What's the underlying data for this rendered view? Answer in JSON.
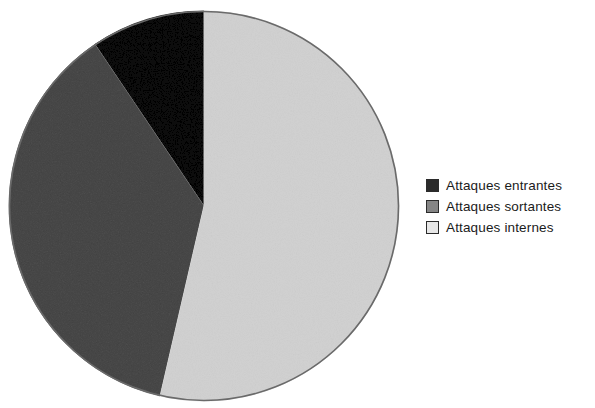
{
  "figure": {
    "background_color": "#ffffff",
    "type": "pie-chart-figure"
  },
  "legend": {
    "position": "right",
    "items": [
      {
        "label": "Attaques entrantes",
        "color": "#2b2b2b",
        "swatch_name": "legend-swatch-attaques-entrantes"
      },
      {
        "label": "Attaques sortantes",
        "color": "#858585",
        "swatch_name": "legend-swatch-attaques-sortantes"
      },
      {
        "label": "Attaques internes",
        "color": "#e7e7e7",
        "swatch_name": "legend-swatch-attaques-internes"
      }
    ]
  },
  "chart_data": {
    "type": "pie",
    "title": "",
    "subtitle": "",
    "xlabel": "",
    "ylabel": "",
    "categories": [
      "Attaques entrantes",
      "Attaques sortantes",
      "Attaques internes"
    ],
    "values": [
      9.5,
      37.0,
      53.5
    ],
    "unit": "%",
    "start_angle_deg": 0,
    "direction": "clockwise",
    "slices": [
      {
        "label": "Attaques entrantes",
        "value": 9.5,
        "color": "#2b2b2b",
        "start_angle_deg": 326,
        "end_angle_deg": 360
      },
      {
        "label": "Attaques sortantes",
        "value": 37.0,
        "color": "#858585",
        "start_angle_deg": 193,
        "end_angle_deg": 326
      },
      {
        "label": "Attaques internes",
        "value": 53.5,
        "color": "#e7e7e7",
        "start_angle_deg": 0,
        "end_angle_deg": 193
      }
    ],
    "legend_position": "right",
    "grid": false,
    "data_labels_shown": false,
    "outline_color": "#555555",
    "center": {
      "x": 198,
      "y": 198
    },
    "radius": 195
  }
}
